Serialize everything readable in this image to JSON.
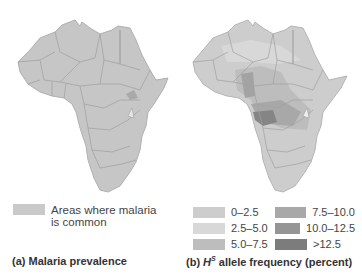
{
  "panel_a": {
    "caption": "(a) Malaria prevalence",
    "legend": {
      "line1": "Areas where malaria",
      "line2": "is common",
      "color": "#c9c9c9"
    },
    "map_fill": "#c6c6c6",
    "border_color": "#9e9e9e"
  },
  "panel_b": {
    "caption_prefix": "(b) ",
    "caption_h": "H",
    "caption_sup": "S",
    "caption_suffix": " allele frequency (percent)",
    "legend": [
      {
        "label": "0–2.5",
        "color": "#cdcdcd"
      },
      {
        "label": "7.5–10.0",
        "color": "#a8a8a8"
      },
      {
        "label": "2.5–5.0",
        "color": "#d8d8d8"
      },
      {
        "label": "10.0–12.5",
        "color": "#959595"
      },
      {
        "label": "5.0–7.5",
        "color": "#bdbdbd"
      },
      {
        "label": ">12.5",
        "color": "#7c7c7c"
      }
    ],
    "map_fill": "#cdcdcd",
    "border_color": "#a0a0a0"
  }
}
